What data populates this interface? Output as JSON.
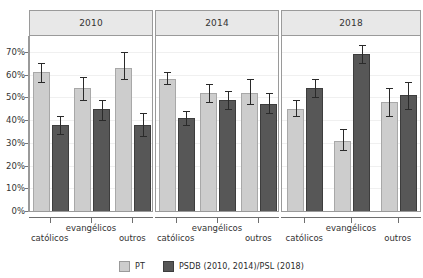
{
  "chart_data": {
    "type": "bar",
    "title": "",
    "subtitle": "",
    "xlabel": "",
    "ylabel": "",
    "ylim": [
      0,
      75
    ],
    "grid": true,
    "orientation": "vertical",
    "error_bars": true,
    "legend_position": "bottom",
    "panels": [
      {
        "header": "2010",
        "categories": [
          "católicos",
          "evangélicos",
          "outros"
        ],
        "series": [
          {
            "name": "PT",
            "color": "#cdcdcd",
            "values": [
              61,
              54,
              63
            ],
            "err_low": [
              57,
              49,
              58
            ],
            "err_high": [
              65,
              59,
              70
            ]
          },
          {
            "name": "PSDB (2010, 2014)/PSL (2018)",
            "color": "#575757",
            "values": [
              38,
              45,
              38
            ],
            "err_low": [
              34,
              40,
              33
            ],
            "err_high": [
              42,
              49,
              43
            ]
          }
        ]
      },
      {
        "header": "2014",
        "categories": [
          "católicos",
          "evangélicos",
          "outros"
        ],
        "series": [
          {
            "name": "PT",
            "color": "#cdcdcd",
            "values": [
              58,
              52,
              52
            ],
            "err_low": [
              56,
              48,
              47
            ],
            "err_high": [
              61,
              56,
              58
            ]
          },
          {
            "name": "PSDB (2010, 2014)/PSL (2018)",
            "color": "#575757",
            "values": [
              41,
              49,
              47
            ],
            "err_low": [
              38,
              45,
              43
            ],
            "err_high": [
              44,
              53,
              52
            ]
          }
        ]
      },
      {
        "header": "2018",
        "categories": [
          "católicos",
          "evangélicos",
          "outros"
        ],
        "series": [
          {
            "name": "PT",
            "color": "#cdcdcd",
            "values": [
              45,
              31,
              48
            ],
            "err_low": [
              42,
              27,
              42
            ],
            "err_high": [
              49,
              36,
              54
            ]
          },
          {
            "name": "PSDB (2010, 2014)/PSL (2018)",
            "color": "#575757",
            "values": [
              54,
              69,
              51
            ],
            "err_low": [
              50,
              65,
              45
            ],
            "err_high": [
              58,
              73,
              57
            ]
          }
        ]
      }
    ],
    "yticks": [
      {
        "value": 0,
        "label": "0%"
      },
      {
        "value": 10,
        "label": "10%"
      },
      {
        "value": 20,
        "label": "20%"
      },
      {
        "value": 30,
        "label": "30%"
      },
      {
        "value": 40,
        "label": "40%"
      },
      {
        "value": 50,
        "label": "50%"
      },
      {
        "value": 60,
        "label": "60%"
      },
      {
        "value": 70,
        "label": "70%"
      }
    ],
    "legend": [
      {
        "label": "PT",
        "color": "#cdcdcd"
      },
      {
        "label": "PSDB (2010, 2014)/PSL (2018)",
        "color": "#575757"
      }
    ]
  }
}
